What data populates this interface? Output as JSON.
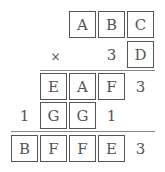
{
  "puzzle": {
    "type": "cryptarithm-multiplication",
    "rows": [
      {
        "name": "multiplicand",
        "cells": [
          {
            "text": "A",
            "boxed": true,
            "x": 69,
            "y": 11
          },
          {
            "text": "B",
            "boxed": true,
            "x": 98,
            "y": 11
          },
          {
            "text": "C",
            "boxed": true,
            "x": 127,
            "y": 11
          }
        ]
      },
      {
        "name": "multiplier",
        "cells": [
          {
            "text": "×",
            "boxed": false,
            "x": 40,
            "y": 41
          },
          {
            "text": "3",
            "boxed": false,
            "x": 98,
            "y": 41
          },
          {
            "text": "D",
            "boxed": true,
            "x": 127,
            "y": 41
          }
        ]
      },
      {
        "name": "partial-product-1",
        "cells": [
          {
            "text": "E",
            "boxed": true,
            "x": 40,
            "y": 73
          },
          {
            "text": "A",
            "boxed": true,
            "x": 69,
            "y": 73
          },
          {
            "text": "F",
            "boxed": true,
            "x": 98,
            "y": 73
          },
          {
            "text": "3",
            "boxed": false,
            "x": 127,
            "y": 73
          }
        ]
      },
      {
        "name": "partial-product-2",
        "cells": [
          {
            "text": "1",
            "boxed": false,
            "x": 11,
            "y": 102
          },
          {
            "text": "G",
            "boxed": true,
            "x": 40,
            "y": 102
          },
          {
            "text": "G",
            "boxed": true,
            "x": 69,
            "y": 102
          },
          {
            "text": "1",
            "boxed": false,
            "x": 98,
            "y": 102
          }
        ]
      },
      {
        "name": "final-product",
        "cells": [
          {
            "text": "B",
            "boxed": true,
            "x": 11,
            "y": 135
          },
          {
            "text": "F",
            "boxed": true,
            "x": 40,
            "y": 135
          },
          {
            "text": "F",
            "boxed": true,
            "x": 69,
            "y": 135
          },
          {
            "text": "E",
            "boxed": true,
            "x": 98,
            "y": 135
          },
          {
            "text": "3",
            "boxed": false,
            "x": 127,
            "y": 135
          }
        ]
      }
    ],
    "rules": [
      {
        "x": 40,
        "y": 70,
        "width": 115
      },
      {
        "x": 11,
        "y": 131,
        "width": 144
      }
    ]
  }
}
